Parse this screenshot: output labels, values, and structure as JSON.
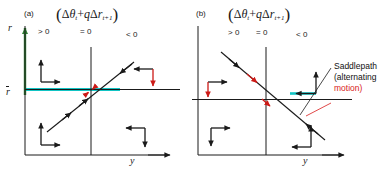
{
  "figure": {
    "width": 384,
    "height": 183,
    "background": "#ffffff"
  },
  "colors": {
    "axis": "#1a1a1a",
    "arrow_black": "#1a1a1a",
    "arrow_red": "#cc1a16",
    "green_axis": "#2f7d32",
    "cyan_line": "#12c4c4",
    "leader_red": "#d81a1a",
    "text": "#111111"
  },
  "panels": [
    {
      "tag": "(a)",
      "formula": {
        "open_paren": "(",
        "delta": "Δ",
        "theta": "θ",
        "theta_sub": "t",
        "plus": "+",
        "q": "q",
        "delta2": "Δ",
        "r": "r",
        "r_sub": "t+1",
        "close_paren": ")"
      },
      "inequalities": [
        {
          "label": "> 0"
        },
        {
          "label": "= 0"
        },
        {
          "label": "< 0"
        }
      ],
      "axes": {
        "y_axis_label": "r",
        "x_axis_label": "y",
        "steady_state_label": "r̄"
      },
      "saddlepath_direction": "upward",
      "saddlepath_note": null
    },
    {
      "tag": "(b)",
      "formula": {
        "open_paren": "(",
        "delta": "Δ",
        "theta": "θ",
        "theta_sub": "t",
        "plus": "+",
        "q": "q",
        "delta2": "Δ",
        "r": "r",
        "r_sub": "t+1",
        "close_paren": ")"
      },
      "inequalities": [
        {
          "label": "> 0"
        },
        {
          "label": "= 0"
        },
        {
          "label": "< 0"
        }
      ],
      "axes": {
        "y_axis_label": "r",
        "x_axis_label": "y",
        "steady_state_label": "r̄"
      },
      "saddlepath_direction": "downward",
      "saddlepath_note": {
        "line1": "Saddlepath",
        "line2": "(alternating",
        "line3": "motion)"
      }
    }
  ]
}
